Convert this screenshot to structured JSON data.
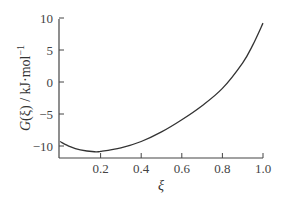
{
  "chart_data": {
    "type": "line",
    "title": "",
    "xlabel": "ξ",
    "ylabel": "G(ξ) / kJ·mol⁻¹",
    "ylabel_parts": {
      "func": "G",
      "arg": "(ξ)",
      "unit": " / kJ·mol",
      "exp": "−1"
    },
    "xlim": [
      0,
      1.0
    ],
    "ylim": [
      -12,
      10
    ],
    "grid": false,
    "legend": null,
    "x_ticks": [
      0.2,
      0.4,
      0.6,
      0.8,
      1.0
    ],
    "x_tick_labels": [
      "0.2",
      "0.4",
      "0.6",
      "0.8",
      "1.0"
    ],
    "y_ticks": [
      10,
      5,
      0,
      -5,
      -10
    ],
    "y_tick_labels": [
      "10",
      "5",
      "0",
      "−5",
      "−10"
    ],
    "series": [
      {
        "name": "G(ξ)",
        "color": "#333333",
        "x": [
          0.0,
          0.05,
          0.1,
          0.17,
          0.2,
          0.3,
          0.4,
          0.5,
          0.6,
          0.7,
          0.8,
          0.9,
          0.95,
          1.0
        ],
        "y": [
          -9.3,
          -10.1,
          -10.6,
          -10.9,
          -10.85,
          -10.3,
          -9.3,
          -7.8,
          -5.9,
          -3.7,
          -1.0,
          3.0,
          5.8,
          9.2
        ]
      }
    ]
  }
}
